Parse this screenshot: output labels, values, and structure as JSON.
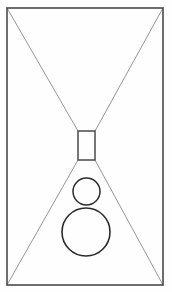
{
  "canvas": {
    "width": 172,
    "height": 292,
    "background_color": "#fefefe",
    "title": "Geometric line drawing"
  },
  "palette": {
    "frame_stroke": "#4a4a4a",
    "diagonal_stroke": "#8a8a8a",
    "shape_stroke": "#2b2b2b",
    "fill": "none",
    "page_background": "#ffffff"
  },
  "diagram": {
    "type": "line-drawing",
    "frame": {
      "name": "outer-frame",
      "x": 7,
      "y": 8,
      "width": 156,
      "height": 277,
      "stroke_width": 1.6,
      "corners": {
        "top_left": [
          7,
          8
        ],
        "top_right": [
          163,
          8
        ],
        "bottom_right": [
          163,
          285
        ],
        "bottom_left": [
          7,
          285
        ]
      }
    },
    "center_rectangle": {
      "name": "center-rectangle",
      "x": 78,
      "y": 131,
      "width": 17,
      "height": 29,
      "stroke_width": 1.5,
      "corners": {
        "top_left": [
          78,
          131
        ],
        "top_right": [
          95,
          131
        ],
        "bottom_right": [
          95,
          160
        ],
        "bottom_left": [
          78,
          160
        ]
      }
    },
    "diagonals": [
      {
        "name": "diagonal-top-left",
        "x1": 7,
        "y1": 8,
        "x2": 78,
        "y2": 131
      },
      {
        "name": "diagonal-top-right",
        "x1": 163,
        "y1": 8,
        "x2": 95,
        "y2": 131
      },
      {
        "name": "diagonal-bottom-left",
        "x1": 78,
        "y1": 160,
        "x2": 7,
        "y2": 285
      },
      {
        "name": "diagonal-bottom-right",
        "x1": 95,
        "y1": 160,
        "x2": 163,
        "y2": 285
      }
    ],
    "diagonal_stroke_width": 0.9,
    "circles": [
      {
        "name": "small-circle",
        "cx": 86.5,
        "cy": 191.5,
        "r": 13.5,
        "stroke_width": 1.5
      },
      {
        "name": "large-circle",
        "cx": 86,
        "cy": 232,
        "r": 24,
        "stroke_width": 1.6
      }
    ]
  }
}
